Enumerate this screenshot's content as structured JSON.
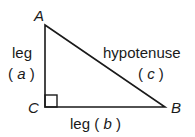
{
  "diagram": {
    "vertices": {
      "A": {
        "label": "A",
        "x": 45,
        "y": 25
      },
      "B": {
        "label": "B",
        "x": 165,
        "y": 107
      },
      "C": {
        "label": "C",
        "x": 45,
        "y": 107
      }
    },
    "right_angle_at": "C",
    "sides": {
      "a": {
        "name": "leg",
        "symbol": "a",
        "open": "(",
        "close": ")"
      },
      "b": {
        "name": "leg",
        "symbol": "b",
        "open": "(",
        "close": ")"
      },
      "c": {
        "name": "hypotenuse",
        "symbol": "c",
        "open": "(",
        "close": ")"
      }
    },
    "colors": {
      "stroke": "#1a1a1a",
      "background": "#ffffff"
    }
  }
}
